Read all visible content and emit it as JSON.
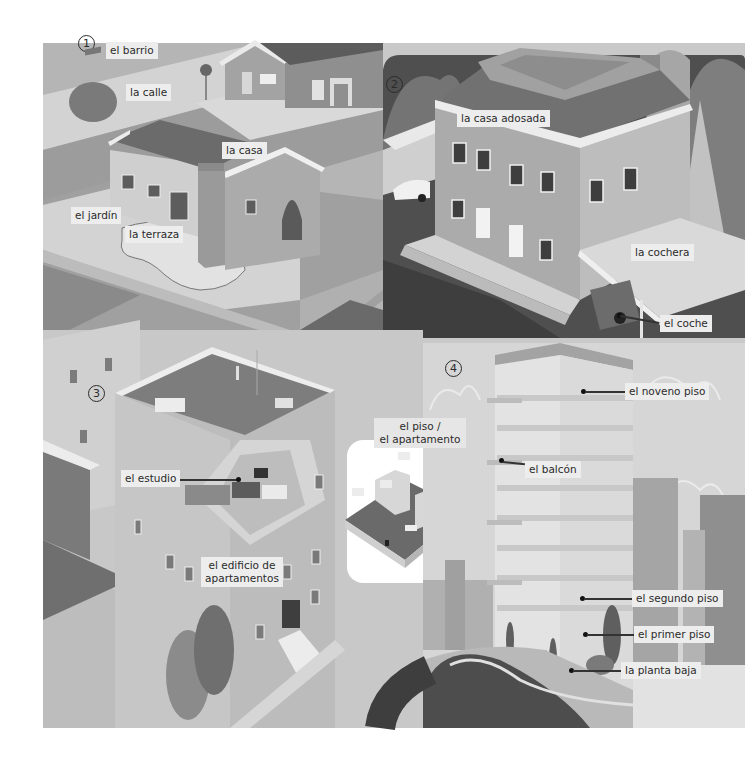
{
  "colors": {
    "page_bg": "#ffffff",
    "label_bg": "#ededed",
    "label_text": "#2b2b2b",
    "light_wall": "#d0d0d0",
    "mid_wall": "#a9a9a9",
    "roof_dark": "#6e6e6e",
    "road_dark": "#4a4a4a",
    "sky": "#d9d9d9"
  },
  "panels": [
    {
      "number": "1",
      "labels": {
        "barrio": "el barrio",
        "calle": "la calle",
        "casa": "la casa",
        "jardin": "el jardín",
        "terraza": "la terraza"
      }
    },
    {
      "number": "2",
      "labels": {
        "casa_adosada": "la casa adosada",
        "cochera": "la cochera",
        "coche": "el coche"
      }
    },
    {
      "number": "3",
      "labels": {
        "estudio": "el estudio",
        "edificio_l1": "el edificio de",
        "edificio_l2": "apartamentos",
        "piso_l1": "el piso /",
        "piso_l2": "el apartamento"
      }
    },
    {
      "number": "4",
      "labels": {
        "noveno": "el noveno piso",
        "balcon": "el balcón",
        "segundo": "el segundo piso",
        "primer": "el primer piso",
        "planta_baja": "la planta baja"
      }
    }
  ]
}
